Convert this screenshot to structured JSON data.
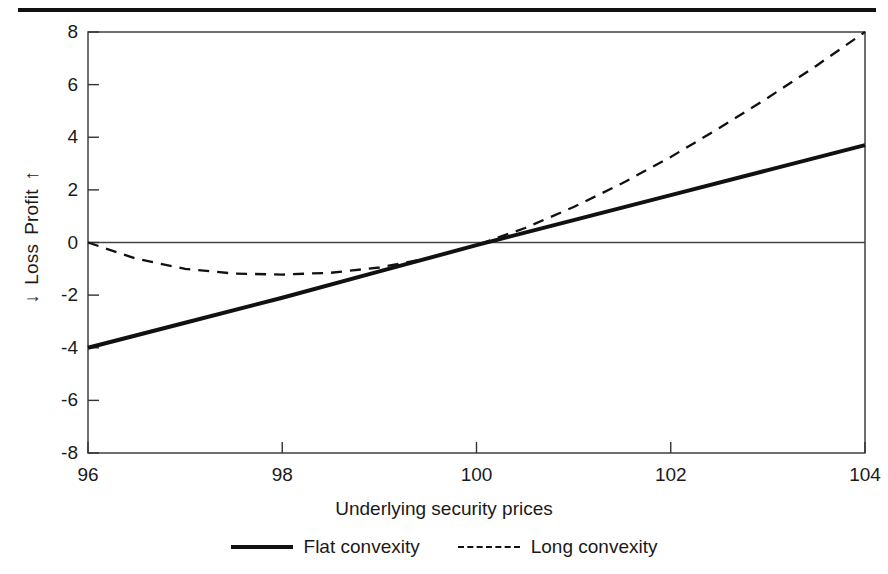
{
  "figure": {
    "top_rule": "top-rule",
    "accent_color": "#111111",
    "background": "#ffffff"
  },
  "axes": {
    "y_label_profit": "Profit",
    "y_label_loss": "Loss",
    "y_arrow_up": "↑",
    "y_arrow_down": "↓",
    "x_title": "Underlying security prices"
  },
  "legend": {
    "items": [
      {
        "label": "Flat convexity",
        "style": "solid"
      },
      {
        "label": "Long convexity",
        "style": "dashed"
      }
    ]
  },
  "chart_data": {
    "type": "line",
    "title": "",
    "xlabel": "Underlying security prices",
    "ylabel": "Loss ↔ Profit",
    "xlim": [
      96,
      104
    ],
    "ylim": [
      -8,
      8
    ],
    "xticks": [
      96,
      98,
      100,
      102,
      104
    ],
    "xtick_labels": [
      "96",
      "98",
      "100",
      "102",
      "104"
    ],
    "yticks": [
      8,
      6,
      4,
      2,
      0,
      -2,
      -4,
      -6,
      -8
    ],
    "ytick_labels": [
      "8",
      "6",
      "4",
      "2",
      "0",
      "-2",
      "-4",
      "-6",
      "-8"
    ],
    "grid": false,
    "zero_line": true,
    "legend_position": "below-axes",
    "series": [
      {
        "name": "Flat convexity",
        "style": "solid",
        "color": "#111111",
        "x": [
          96,
          97,
          98,
          99,
          100,
          101,
          102,
          103,
          104
        ],
        "values": [
          -4.0,
          -3.05,
          -2.1,
          -1.1,
          -0.1,
          0.85,
          1.8,
          2.75,
          3.7
        ]
      },
      {
        "name": "Long convexity",
        "style": "dashed",
        "color": "#111111",
        "x": [
          96,
          96.5,
          97,
          97.5,
          98,
          98.5,
          99,
          99.5,
          100,
          100.5,
          101,
          101.5,
          102,
          102.5,
          103,
          103.5,
          104
        ],
        "values": [
          0.0,
          -0.62,
          -1.0,
          -1.18,
          -1.22,
          -1.15,
          -0.95,
          -0.6,
          -0.1,
          0.55,
          1.35,
          2.25,
          3.25,
          4.35,
          5.5,
          6.72,
          8.0
        ]
      }
    ]
  }
}
